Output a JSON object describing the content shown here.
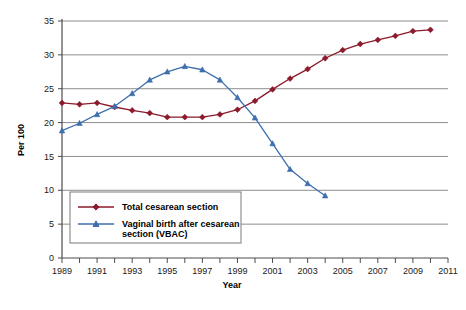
{
  "chart_data": {
    "type": "line",
    "title": "",
    "xlabel": "Year",
    "ylabel": "Per 100",
    "xlim": [
      1989,
      2011
    ],
    "ylim": [
      0,
      35
    ],
    "ytick_step": 5,
    "yticks": [
      "0",
      "5",
      "10",
      "15",
      "20",
      "25",
      "30",
      "35"
    ],
    "xticks_major": [
      "1989",
      "1991",
      "1993",
      "1995",
      "1997",
      "1999",
      "2001",
      "2003",
      "2005",
      "2007",
      "2009",
      "2011"
    ],
    "xticks_all": [
      1989,
      1990,
      1991,
      1992,
      1993,
      1994,
      1995,
      1996,
      1997,
      1998,
      1999,
      2000,
      2001,
      2002,
      2003,
      2004,
      2005,
      2006,
      2007,
      2008,
      2009,
      2010,
      2011
    ],
    "grid": "horizontal",
    "legend_position": "inside-lower-left",
    "x": [
      1989,
      1990,
      1991,
      1992,
      1993,
      1994,
      1995,
      1996,
      1997,
      1998,
      1999,
      2000,
      2001,
      2002,
      2003,
      2004,
      2005,
      2006,
      2007,
      2008,
      2009,
      2010
    ],
    "series": [
      {
        "name": "Total cesarean section",
        "color": "#8B1A2B",
        "marker": "diamond",
        "x": [
          1989,
          1990,
          1991,
          1992,
          1993,
          1994,
          1995,
          1996,
          1997,
          1998,
          1999,
          2000,
          2001,
          2002,
          2003,
          2004,
          2005,
          2006,
          2007,
          2008,
          2009,
          2010
        ],
        "values": [
          22.9,
          22.7,
          22.9,
          22.3,
          21.8,
          21.4,
          20.8,
          20.8,
          20.8,
          21.2,
          21.9,
          23.2,
          24.9,
          26.5,
          27.9,
          29.5,
          30.7,
          31.6,
          32.2,
          32.8,
          33.5,
          33.7
        ]
      },
      {
        "name": "Vaginal birth after cesarean section (VBAC)",
        "color": "#3D6EAE",
        "marker": "triangle",
        "x": [
          1989,
          1990,
          1991,
          1992,
          1993,
          1994,
          1995,
          1996,
          1997,
          1998,
          1999,
          2000,
          2001,
          2002,
          2003,
          2004
        ],
        "values": [
          18.8,
          19.9,
          21.2,
          22.4,
          24.3,
          26.3,
          27.5,
          28.3,
          27.8,
          26.3,
          23.7,
          20.7,
          16.9,
          13.1,
          11.0,
          9.2
        ]
      }
    ],
    "legend_entries": [
      {
        "label": "Total cesarean section",
        "color": "#8B1A2B",
        "marker": "diamond"
      },
      {
        "label": "Vaginal birth after cesarean",
        "label2": "section (VBAC)",
        "color": "#3D6EAE",
        "marker": "triangle"
      }
    ],
    "colors": {
      "cesarean": "#8B1A2B",
      "vbac": "#3D6EAE",
      "grid": "#808080",
      "axis": "#4d4d4d",
      "background": "#ffffff"
    }
  }
}
